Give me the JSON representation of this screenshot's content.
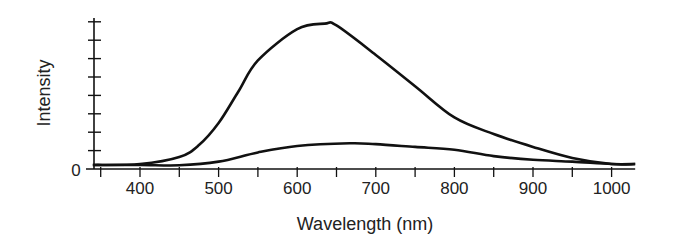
{
  "chart_data": {
    "type": "line",
    "title": "",
    "xlabel": "Wavelength (nm)",
    "ylabel": "Intensity",
    "xlim": [
      340,
      1030
    ],
    "ylim": [
      0,
      8
    ],
    "x_ticks_major": [
      400,
      500,
      600,
      700,
      800,
      900,
      1000
    ],
    "x_tick_labels": [
      "400",
      "500",
      "600",
      "700",
      "800",
      "900",
      "1000"
    ],
    "x_ticks_minor": [
      350,
      450,
      550,
      650,
      750,
      850,
      950
    ],
    "y_ticks": [
      1,
      2,
      3,
      4,
      5,
      6,
      7,
      8
    ],
    "y_tick_labels": [
      "0"
    ],
    "grid": false,
    "legend": null,
    "line_color": "#111111",
    "series": [
      {
        "name": "high-intensity emission",
        "x": [
          340,
          400,
          450,
          475,
          500,
          525,
          550,
          600,
          635,
          650,
          700,
          750,
          800,
          850,
          900,
          950,
          1000,
          1030
        ],
        "values": [
          0.22,
          0.27,
          0.65,
          1.3,
          2.5,
          4.2,
          5.9,
          7.6,
          7.9,
          7.8,
          6.2,
          4.5,
          2.8,
          1.9,
          1.2,
          0.6,
          0.27,
          0.27
        ]
      },
      {
        "name": "low-intensity emission",
        "x": [
          340,
          400,
          450,
          500,
          550,
          600,
          667,
          700,
          750,
          800,
          850,
          900,
          950,
          1000,
          1030
        ],
        "values": [
          0.22,
          0.22,
          0.2,
          0.4,
          0.9,
          1.25,
          1.4,
          1.35,
          1.2,
          1.05,
          0.7,
          0.5,
          0.4,
          0.27,
          0.27
        ]
      }
    ]
  }
}
